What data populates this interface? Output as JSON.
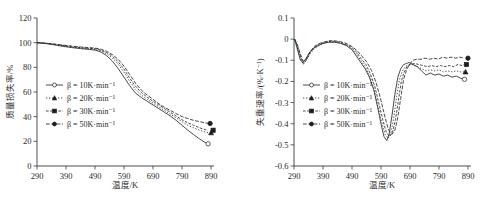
{
  "figure": {
    "panels": [
      {
        "id": "tga",
        "axis": {
          "xlabel": "温度/K",
          "ylabel": "质量损失率/%",
          "xticks": [
            "290",
            "390",
            "490",
            "590",
            "690",
            "790",
            "890"
          ],
          "yticks": [
            "0",
            "20",
            "40",
            "60",
            "80",
            "100",
            "120"
          ]
        },
        "legend": [
          {
            "label": "β = 10K·min⁻¹",
            "marker": "open-circle",
            "dash": "solid"
          },
          {
            "label": "β = 20K·min⁻¹",
            "marker": "filled-triangle",
            "dash": "dotted"
          },
          {
            "label": "β = 30K·min⁻¹",
            "marker": "filled-square",
            "dash": "dash-dot"
          },
          {
            "label": "β = 50K·min⁻¹",
            "marker": "filled-circle",
            "dash": "dash-dot-long"
          }
        ]
      },
      {
        "id": "dtg",
        "axis": {
          "xlabel": "温度/K",
          "ylabel": "失重速率/(%·K⁻¹)",
          "xticks": [
            "290",
            "390",
            "490",
            "590",
            "690",
            "790",
            "890"
          ],
          "yticks": [
            "-0.6",
            "-0.5",
            "-0.4",
            "-0.3",
            "-0.2",
            "-0.1",
            "0",
            "0.1"
          ]
        },
        "legend": [
          {
            "label": "β = 10K·min⁻¹",
            "marker": "open-circle",
            "dash": "solid"
          },
          {
            "label": "β = 20K·min⁻¹",
            "marker": "filled-triangle",
            "dash": "dotted"
          },
          {
            "label": "β = 30K·min⁻¹",
            "marker": "filled-square",
            "dash": "dash-dot"
          },
          {
            "label": "β = 50K·min⁻¹",
            "marker": "filled-circle",
            "dash": "dash-dot-long"
          }
        ]
      }
    ]
  },
  "chart_data": [
    {
      "type": "line",
      "id": "tga",
      "title": "",
      "xlabel": "温度/K",
      "ylabel": "质量损失率/%",
      "xlim": [
        290,
        890
      ],
      "ylim": [
        0,
        120
      ],
      "xticks": [
        290,
        390,
        490,
        590,
        690,
        790,
        890
      ],
      "yticks": [
        0,
        20,
        40,
        60,
        80,
        100,
        120
      ],
      "grid": false,
      "legend_position": "center-left",
      "series": [
        {
          "name": "β = 10K·min⁻¹",
          "marker": "open-circle",
          "linestyle": "solid",
          "x": [
            290,
            320,
            350,
            380,
            410,
            440,
            470,
            490,
            510,
            530,
            550,
            570,
            590,
            610,
            630,
            650,
            670,
            690,
            710,
            730,
            750,
            770,
            790,
            810,
            830,
            850,
            870,
            880
          ],
          "y": [
            100,
            99.3,
            98.2,
            97.0,
            96.0,
            95.2,
            94.5,
            94.0,
            92.5,
            89.5,
            85.0,
            79.0,
            72.0,
            65.0,
            59.0,
            55.5,
            52.5,
            49.5,
            46.5,
            43.5,
            40.5,
            37.0,
            33.0,
            29.0,
            25.5,
            22.0,
            19.0,
            18.0
          ]
        },
        {
          "name": "β = 20K·min⁻¹",
          "marker": "filled-triangle",
          "linestyle": "dotted",
          "x": [
            290,
            320,
            350,
            380,
            410,
            440,
            470,
            490,
            510,
            530,
            550,
            570,
            590,
            610,
            630,
            650,
            670,
            690,
            710,
            730,
            750,
            770,
            790,
            810,
            830,
            850,
            870,
            880
          ],
          "y": [
            100,
            99.4,
            98.5,
            97.4,
            96.4,
            95.6,
            95.0,
            94.6,
            93.4,
            91.0,
            87.5,
            82.5,
            76.0,
            68.5,
            62.0,
            57.5,
            54.0,
            51.0,
            48.0,
            45.0,
            42.0,
            39.0,
            36.0,
            33.0,
            31.0,
            29.0,
            27.5,
            27.0
          ]
        },
        {
          "name": "β = 30K·min⁻¹",
          "marker": "filled-square",
          "linestyle": "dash-dot",
          "x": [
            290,
            320,
            350,
            380,
            410,
            440,
            470,
            490,
            510,
            530,
            550,
            570,
            590,
            610,
            630,
            650,
            670,
            690,
            710,
            730,
            750,
            770,
            790,
            810,
            830,
            850,
            870,
            880
          ],
          "y": [
            100,
            99.5,
            98.7,
            97.7,
            96.8,
            96.0,
            95.4,
            95.0,
            94.0,
            92.0,
            89.0,
            84.5,
            78.5,
            71.0,
            64.5,
            59.5,
            55.8,
            52.5,
            49.5,
            46.5,
            43.5,
            40.5,
            37.5,
            35.0,
            33.0,
            31.0,
            29.5,
            29.0
          ]
        },
        {
          "name": "β = 50K·min⁻¹",
          "marker": "filled-circle",
          "linestyle": "dash-dot-long",
          "x": [
            290,
            320,
            350,
            380,
            410,
            440,
            470,
            490,
            510,
            530,
            550,
            570,
            590,
            610,
            630,
            650,
            670,
            690,
            710,
            730,
            750,
            770,
            790,
            810,
            830,
            850,
            870,
            880
          ],
          "y": [
            100,
            99.6,
            98.9,
            98.0,
            97.2,
            96.5,
            96.0,
            95.6,
            94.8,
            93.0,
            90.3,
            86.5,
            81.0,
            74.0,
            67.0,
            61.5,
            57.5,
            54.0,
            50.5,
            47.5,
            45.0,
            42.5,
            40.0,
            38.5,
            37.0,
            36.0,
            35.0,
            34.5
          ]
        }
      ]
    },
    {
      "type": "line",
      "id": "dtg",
      "title": "",
      "xlabel": "温度/K",
      "ylabel": "失重速率/(%·K⁻¹)",
      "xlim": [
        290,
        890
      ],
      "ylim": [
        -0.6,
        0.1
      ],
      "xticks": [
        290,
        390,
        490,
        590,
        690,
        790,
        890
      ],
      "yticks": [
        -0.6,
        -0.5,
        -0.4,
        -0.3,
        -0.2,
        -0.1,
        0,
        0.1
      ],
      "grid": false,
      "legend_position": "center-left",
      "series": [
        {
          "name": "β = 10K·min⁻¹",
          "marker": "open-circle",
          "linestyle": "solid",
          "x": [
            292,
            300,
            312,
            322,
            332,
            345,
            360,
            375,
            390,
            410,
            430,
            450,
            470,
            490,
            505,
            520,
            535,
            550,
            565,
            578,
            590,
            600,
            610,
            618,
            628,
            638,
            648,
            658,
            668,
            678,
            688,
            700,
            715,
            730,
            745,
            760,
            775,
            790,
            805,
            820,
            835,
            850,
            865,
            878
          ],
          "y": [
            0.0,
            -0.04,
            -0.1,
            -0.11,
            -0.09,
            -0.06,
            -0.04,
            -0.03,
            -0.02,
            -0.015,
            -0.015,
            -0.02,
            -0.03,
            -0.05,
            -0.08,
            -0.11,
            -0.14,
            -0.18,
            -0.24,
            -0.32,
            -0.4,
            -0.46,
            -0.48,
            -0.45,
            -0.36,
            -0.26,
            -0.18,
            -0.14,
            -0.12,
            -0.115,
            -0.11,
            -0.12,
            -0.13,
            -0.15,
            -0.17,
            -0.16,
            -0.17,
            -0.165,
            -0.175,
            -0.17,
            -0.18,
            -0.175,
            -0.185,
            -0.19
          ]
        },
        {
          "name": "β = 20K·min⁻¹",
          "marker": "filled-triangle",
          "linestyle": "dotted",
          "x": [
            292,
            300,
            312,
            322,
            332,
            345,
            360,
            375,
            390,
            410,
            430,
            450,
            470,
            490,
            505,
            520,
            535,
            550,
            565,
            578,
            592,
            604,
            615,
            625,
            634,
            644,
            654,
            664,
            674,
            686,
            700,
            715,
            730,
            745,
            760,
            775,
            790,
            805,
            820,
            835,
            850,
            865,
            878
          ],
          "y": [
            0.0,
            -0.03,
            -0.09,
            -0.12,
            -0.1,
            -0.07,
            -0.045,
            -0.03,
            -0.02,
            -0.012,
            -0.012,
            -0.018,
            -0.028,
            -0.045,
            -0.07,
            -0.1,
            -0.13,
            -0.17,
            -0.23,
            -0.31,
            -0.39,
            -0.45,
            -0.47,
            -0.44,
            -0.37,
            -0.27,
            -0.19,
            -0.15,
            -0.13,
            -0.12,
            -0.12,
            -0.13,
            -0.14,
            -0.15,
            -0.145,
            -0.15,
            -0.145,
            -0.155,
            -0.15,
            -0.155,
            -0.15,
            -0.155,
            -0.155
          ]
        },
        {
          "name": "β = 30K·min⁻¹",
          "marker": "filled-square",
          "linestyle": "dash-dot",
          "x": [
            292,
            300,
            312,
            322,
            332,
            345,
            360,
            375,
            390,
            410,
            430,
            450,
            470,
            490,
            505,
            520,
            538,
            552,
            568,
            582,
            596,
            608,
            620,
            630,
            640,
            650,
            660,
            670,
            680,
            692,
            706,
            720,
            735,
            750,
            765,
            780,
            795,
            810,
            825,
            840,
            855,
            870,
            878
          ],
          "y": [
            0.0,
            -0.025,
            -0.08,
            -0.115,
            -0.1,
            -0.065,
            -0.04,
            -0.025,
            -0.018,
            -0.01,
            -0.01,
            -0.015,
            -0.025,
            -0.04,
            -0.06,
            -0.09,
            -0.12,
            -0.16,
            -0.22,
            -0.3,
            -0.38,
            -0.44,
            -0.46,
            -0.44,
            -0.38,
            -0.29,
            -0.2,
            -0.155,
            -0.13,
            -0.12,
            -0.115,
            -0.12,
            -0.125,
            -0.13,
            -0.125,
            -0.13,
            -0.125,
            -0.13,
            -0.125,
            -0.13,
            -0.12,
            -0.125,
            -0.12
          ]
        },
        {
          "name": "β = 50K·min⁻¹",
          "marker": "filled-circle",
          "linestyle": "dash-dot-long",
          "x": [
            292,
            300,
            312,
            322,
            332,
            345,
            360,
            375,
            390,
            410,
            430,
            450,
            470,
            490,
            508,
            524,
            542,
            558,
            574,
            590,
            604,
            616,
            628,
            638,
            648,
            658,
            668,
            678,
            688,
            700,
            714,
            728,
            742,
            758,
            772,
            788,
            802,
            818,
            832,
            848,
            862,
            876
          ],
          "y": [
            0.0,
            -0.02,
            -0.07,
            -0.105,
            -0.095,
            -0.06,
            -0.035,
            -0.022,
            -0.015,
            -0.008,
            -0.008,
            -0.012,
            -0.02,
            -0.035,
            -0.055,
            -0.08,
            -0.11,
            -0.15,
            -0.21,
            -0.29,
            -0.37,
            -0.43,
            -0.45,
            -0.43,
            -0.37,
            -0.28,
            -0.19,
            -0.145,
            -0.12,
            -0.1,
            -0.095,
            -0.095,
            -0.09,
            -0.095,
            -0.09,
            -0.095,
            -0.085,
            -0.09,
            -0.085,
            -0.09,
            -0.085,
            -0.09
          ]
        }
      ]
    }
  ]
}
